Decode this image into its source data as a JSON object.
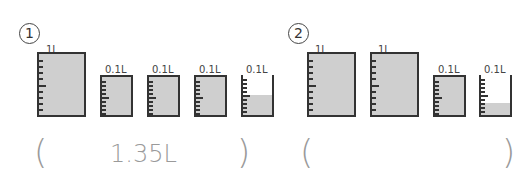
{
  "problems": [
    {
      "number": "1",
      "answer": "1.35L",
      "beakers": [
        {
          "label": "1L",
          "capacity": "1L",
          "fill_tenths": 10
        },
        {
          "label": "0.1L",
          "capacity": "0.1L",
          "fill_tenths": 10
        },
        {
          "label": "0.1L",
          "capacity": "0.1L",
          "fill_tenths": 10
        },
        {
          "label": "0.1L",
          "capacity": "0.1L",
          "fill_tenths": 10
        },
        {
          "label": "0.1L",
          "capacity": "0.1L",
          "fill_tenths": 5
        }
      ]
    },
    {
      "number": "2",
      "answer": "",
      "beakers": [
        {
          "label": "1L",
          "capacity": "1L",
          "fill_tenths": 10
        },
        {
          "label": "1L",
          "capacity": "1L",
          "fill_tenths": 10
        },
        {
          "label": "0.1L",
          "capacity": "0.1L",
          "fill_tenths": 10
        },
        {
          "label": "0.1L",
          "capacity": "0.1L",
          "fill_tenths": 3
        }
      ]
    }
  ],
  "paren_open": "(",
  "paren_close": ")",
  "colors": {
    "liquid": "#cfcfcf",
    "outline": "#333333",
    "answer_text": "#9a9a9a"
  }
}
